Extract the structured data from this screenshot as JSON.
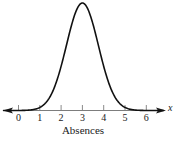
{
  "chart_data": {
    "type": "line",
    "title": "",
    "subtitle": "",
    "xlabel": "Absences",
    "ylabel": "",
    "axis_variable": "x",
    "xlim": [
      -0.7,
      6.8
    ],
    "ylim": [
      0,
      1.05
    ],
    "grid": false,
    "legend": null,
    "annotations": [],
    "distribution": {
      "shape": "normal",
      "mean": 3,
      "sigma": 0.75,
      "peak_x": 3,
      "peak_y": 1.0
    },
    "xticks": [
      0,
      1,
      2,
      3,
      4,
      5,
      6
    ],
    "xtick_labels": [
      "0",
      "1",
      "2",
      "3",
      "4",
      "5",
      "6"
    ],
    "x": [
      -0.7,
      -0.4,
      -0.1,
      0.2,
      0.5,
      0.8,
      1.1,
      1.4,
      1.7,
      2.0,
      2.3,
      2.6,
      2.9,
      3.0,
      3.1,
      3.4,
      3.7,
      4.0,
      4.3,
      4.6,
      4.9,
      5.2,
      5.5,
      5.8,
      6.1,
      6.4,
      6.8
    ],
    "y": [
      0.0,
      0.0,
      0.001,
      0.004,
      0.012,
      0.033,
      0.079,
      0.161,
      0.28,
      0.411,
      0.608,
      0.835,
      0.991,
      1.0,
      0.991,
      0.835,
      0.608,
      0.411,
      0.28,
      0.161,
      0.079,
      0.033,
      0.012,
      0.004,
      0.001,
      0.0,
      0.0
    ],
    "series": [
      {
        "name": "Normal distribution of absences",
        "values": [
          0.0,
          0.0,
          0.001,
          0.004,
          0.012,
          0.033,
          0.079,
          0.161,
          0.28,
          0.411,
          0.608,
          0.835,
          0.991,
          1.0,
          0.991,
          0.835,
          0.608,
          0.411,
          0.28,
          0.161,
          0.079,
          0.033,
          0.012,
          0.004,
          0.001,
          0.0,
          0.0
        ],
        "color": "#111111"
      }
    ]
  },
  "colors": {
    "curve": "#111111",
    "axis": "#7d7d7d",
    "tick": "#8a8a8a",
    "text": "#1a1a1a",
    "background": "#ffffff"
  }
}
